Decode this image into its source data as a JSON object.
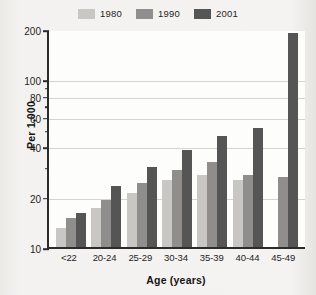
{
  "chart_data": {
    "type": "bar",
    "title": "",
    "xlabel": "Age (years)",
    "ylabel": "Per 1,000",
    "categories": [
      "<22",
      "20-24",
      "25-29",
      "30-34",
      "35-39",
      "40-44",
      "45-49"
    ],
    "series": [
      {
        "name": "1980",
        "color": "#c9c7c4",
        "values": [
          13,
          17,
          21,
          25,
          27,
          25,
          10
        ]
      },
      {
        "name": "1990",
        "color": "#8f8e8c",
        "values": [
          15,
          19,
          24,
          29,
          32,
          27,
          26
        ]
      },
      {
        "name": "2001",
        "color": "#565555",
        "values": [
          16,
          23,
          30,
          38,
          46,
          51,
          190
        ]
      }
    ],
    "yscale": "log",
    "ylim": [
      10,
      200
    ],
    "yticks": [
      10,
      20,
      40,
      60,
      80,
      100,
      200
    ],
    "ytick_labels": [
      "10",
      "20",
      "40",
      "60",
      "80",
      "100",
      "200"
    ],
    "yticks_minor": [
      30,
      50,
      70,
      90
    ],
    "gridlines": [
      20,
      40,
      60,
      80,
      100
    ],
    "grid": true,
    "legend_position": "top-center"
  },
  "legend": {
    "items": [
      {
        "label": "1980",
        "swatch_name": "legend-swatch-1980"
      },
      {
        "label": "1990",
        "swatch_name": "legend-swatch-1990"
      },
      {
        "label": "2001",
        "swatch_name": "legend-swatch-2001"
      }
    ]
  },
  "colors": {
    "series_1980": "#c9c7c4",
    "series_1990": "#8f8e8c",
    "series_2001": "#565555",
    "axis": "#2b2b2b",
    "grid": "#d6d4d1",
    "plot_background": "#fdfdfc",
    "page_background": "#f2f0ee"
  }
}
